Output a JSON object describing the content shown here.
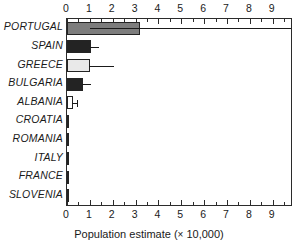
{
  "chart_data": {
    "type": "bar",
    "orientation": "horizontal",
    "title": "",
    "xlabel": "Population estimate (× 10,000)",
    "ylabel": "",
    "xlim": [
      0,
      9.8
    ],
    "grid": false,
    "legend": null,
    "axis_top_duplicated": true,
    "xticks": [
      0,
      1,
      2,
      3,
      4,
      5,
      6,
      7,
      8,
      9
    ],
    "xticklabels": [
      "0",
      "1",
      "2",
      "3",
      "4",
      "5",
      "6",
      "7",
      "8",
      "9"
    ],
    "minor_tick_interval": 0.5,
    "categories": [
      "PORTUGAL",
      "SPAIN",
      "GREECE",
      "BULGARIA",
      "ALBANIA",
      "CROATIA",
      "ROMANIA",
      "ITALY",
      "FRANCE",
      "SLOVENIA"
    ],
    "values": [
      3.2,
      1.05,
      1.0,
      0.72,
      0.26,
      0.02,
      0.02,
      0.02,
      0.02,
      0.02
    ],
    "error_high": [
      9.9,
      1.38,
      2.05,
      1.07,
      0.42,
      null,
      null,
      null,
      null,
      null
    ],
    "error_low": [
      1.0,
      null,
      null,
      null,
      null,
      null,
      null,
      null,
      null,
      null
    ],
    "bar_fill_colors": [
      "#7d7d7d",
      "#232323",
      "#e9e9e9",
      "#232323",
      "#ffffff",
      "#8c8c8c",
      "#8c8c8c",
      "#8c8c8c",
      "#8c8c8c",
      "#8c8c8c"
    ],
    "bar_edge_color": "#242424",
    "axis_color": "#2b2b2b",
    "background_color": "#ffffff"
  },
  "labels": {
    "xaxis_title_main": "Population estimate (",
    "xaxis_title_times": "×",
    "xaxis_title_tail": " 10,000)"
  }
}
